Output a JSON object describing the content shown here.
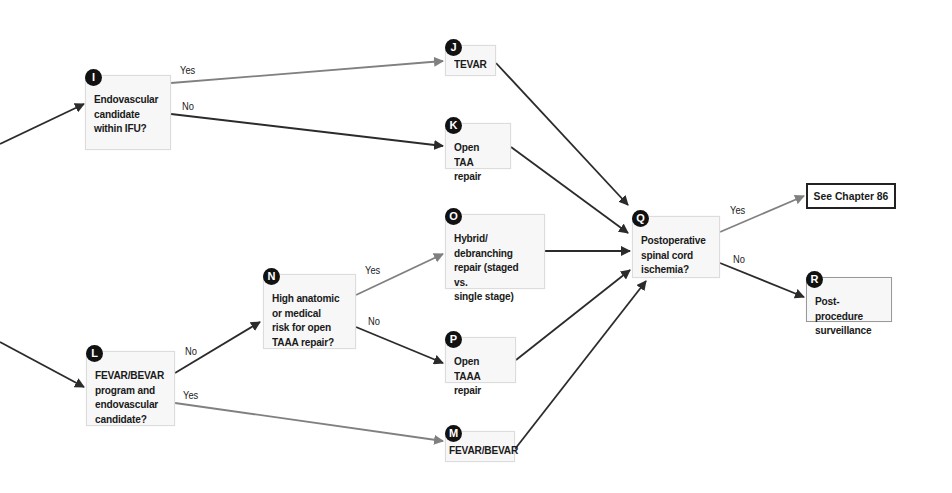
{
  "colors": {
    "yes_edge": "#808080",
    "no_edge": "#2b2b2b",
    "badge": "#111111",
    "node_fill": "#f7f7f7"
  },
  "nodes": {
    "I": {
      "badge": "I",
      "text": "Endovascular\ncandidate\nwithin IFU?"
    },
    "J": {
      "badge": "J",
      "text": "TEVAR"
    },
    "K": {
      "badge": "K",
      "text": "Open TAA\nrepair"
    },
    "L": {
      "badge": "L",
      "text": "FEVAR/BEVAR\nprogram and\nendovascular\ncandidate?"
    },
    "M": {
      "badge": "M",
      "text": "FEVAR/BEVAR"
    },
    "N": {
      "badge": "N",
      "text": "High anatomic\nor medical\nrisk for open\nTAAA repair?"
    },
    "O": {
      "badge": "O",
      "text": "Hybrid/\ndebranching\nrepair (staged vs.\nsingle stage)"
    },
    "P": {
      "badge": "P",
      "text": "Open TAAA\nrepair"
    },
    "Q": {
      "badge": "Q",
      "text": "Postoperative\nspinal cord\nischemia?"
    },
    "R": {
      "badge": "R",
      "text": "Post-procedure\nsurveillance"
    },
    "ref": {
      "text": "See Chapter 86"
    }
  },
  "edge_labels": {
    "i_yes": "Yes",
    "i_no": "No",
    "l_no": "No",
    "l_yes": "Yes",
    "n_yes": "Yes",
    "n_no": "No",
    "q_yes": "Yes",
    "q_no": "No"
  }
}
